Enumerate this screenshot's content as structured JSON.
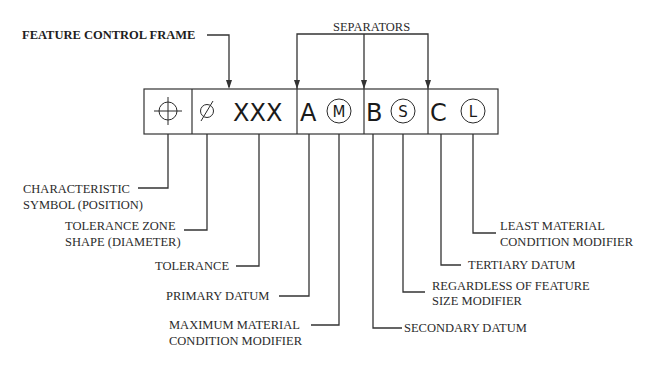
{
  "diagram": {
    "type": "annotated-feature-control-frame",
    "title_callout": "FEATURE CONTROL FRAME",
    "separators_callout": "SEPARATORS",
    "colors": {
      "ink": "#2b2b2b",
      "background": "#ffffff"
    },
    "frame": {
      "cells": [
        {
          "id": "characteristic",
          "symbol": "position-icon",
          "text": ""
        },
        {
          "id": "tolerance",
          "symbol": "diameter-icon",
          "glyph": "Ø",
          "text": "XXX"
        },
        {
          "id": "primary",
          "datum": "A",
          "modifier": "M"
        },
        {
          "id": "secondary",
          "datum": "B",
          "modifier": "S"
        },
        {
          "id": "tertiary",
          "datum": "C",
          "modifier": "L"
        }
      ]
    },
    "labels": {
      "characteristic": [
        "CHARACTERISTIC",
        "SYMBOL (POSITION)"
      ],
      "zone_shape": [
        "TOLERANCE ZONE",
        "SHAPE (DIAMETER)"
      ],
      "tolerance": [
        "TOLERANCE"
      ],
      "primary_datum": [
        "PRIMARY DATUM"
      ],
      "mmc_modifier": [
        "MAXIMUM MATERIAL",
        "CONDITION MODIFIER"
      ],
      "secondary_datum": [
        "SECONDARY DATUM"
      ],
      "rfs_modifier": [
        "REGARDLESS OF FEATURE",
        "SIZE MODIFIER"
      ],
      "tertiary_datum": [
        "TERTIARY DATUM"
      ],
      "lmc_modifier": [
        "LEAST MATERIAL",
        "CONDITION MODIFIER"
      ]
    }
  }
}
